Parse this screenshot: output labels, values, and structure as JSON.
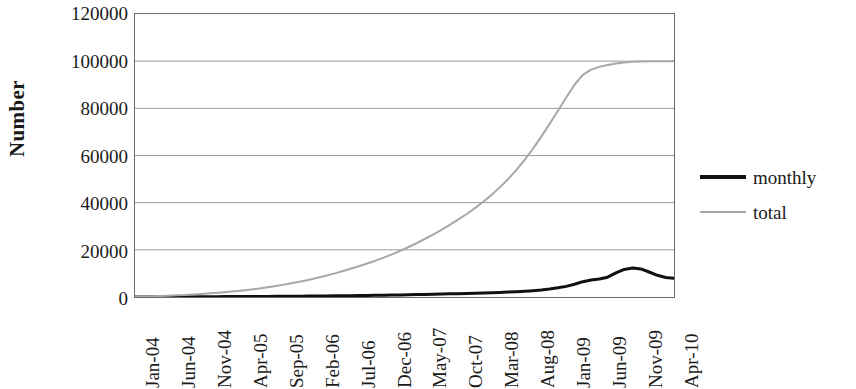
{
  "chart_data": {
    "type": "line",
    "title": "",
    "xlabel": "",
    "ylabel": "Number",
    "ylim": [
      0,
      120000
    ],
    "y_ticks": [
      0,
      20000,
      40000,
      60000,
      80000,
      100000,
      120000
    ],
    "y_tick_labels": [
      "0",
      "20000",
      "40000",
      "60000",
      "80000",
      "100000",
      "120000"
    ],
    "grid": "horizontal",
    "legend_position": "right",
    "categories": [
      "Jan-04",
      "Jun-04",
      "Nov-04",
      "Apr-05",
      "Sep-05",
      "Feb-06",
      "Jul-06",
      "Dec-06",
      "May-07",
      "Oct-07",
      "Mar-08",
      "Aug-08",
      "Jan-09",
      "Jun-09",
      "Nov-09",
      "Apr-10"
    ],
    "series": [
      {
        "name": "monthly",
        "color": "#101010",
        "line_width": 3,
        "values": [
          60,
          90,
          140,
          200,
          280,
          380,
          500,
          700,
          950,
          1250,
          1600,
          2100,
          3200,
          5600,
          11800,
          7800
        ]
      },
      {
        "name": "total",
        "color": "#a8a8a8",
        "line_width": 2,
        "values": [
          100,
          500,
          1200,
          2200,
          3600,
          5400,
          7800,
          11000,
          15000,
          20000,
          26000,
          34000,
          46000,
          62000,
          84000,
          100000
        ]
      }
    ],
    "series_monthly_dense": [
      0,
      40,
      60,
      70,
      80,
      90,
      100,
      110,
      120,
      130,
      145,
      160,
      175,
      190,
      210,
      230,
      250,
      270,
      295,
      320,
      350,
      380,
      410,
      445,
      480,
      520,
      560,
      600,
      650,
      700,
      760,
      820,
      880,
      950,
      1020,
      1100,
      1180,
      1260,
      1340,
      1430,
      1520,
      1620,
      1720,
      1830,
      1950,
      2080,
      2250,
      2450,
      2700,
      3000,
      3400,
      3900,
      4500,
      5400,
      6500,
      7200,
      7600,
      8400,
      10200,
      11700,
      12300,
      11900,
      10600,
      9200,
      8300,
      7900
    ],
    "series_total_dense": [
      100,
      180,
      280,
      400,
      540,
      700,
      880,
      1080,
      1300,
      1540,
      1800,
      2080,
      2400,
      2750,
      3150,
      3600,
      4100,
      4650,
      5250,
      5900,
      6600,
      7350,
      8150,
      9000,
      9900,
      10900,
      11950,
      13050,
      14200,
      15400,
      16700,
      18100,
      19600,
      21200,
      22900,
      24700,
      26600,
      28600,
      30700,
      32900,
      35200,
      37700,
      40400,
      43300,
      46500,
      50000,
      53900,
      58200,
      62900,
      68000,
      73400,
      79000,
      84600,
      90000,
      94200,
      96400,
      97600,
      98400,
      99000,
      99400,
      99700,
      99850,
      99920,
      99960,
      99980,
      100000
    ]
  },
  "legend": {
    "entries": [
      {
        "label": "monthly",
        "swatch": "thick-black-line"
      },
      {
        "label": "total",
        "swatch": "thin-gray-line"
      }
    ]
  },
  "axes": {
    "y_title": "Number"
  }
}
